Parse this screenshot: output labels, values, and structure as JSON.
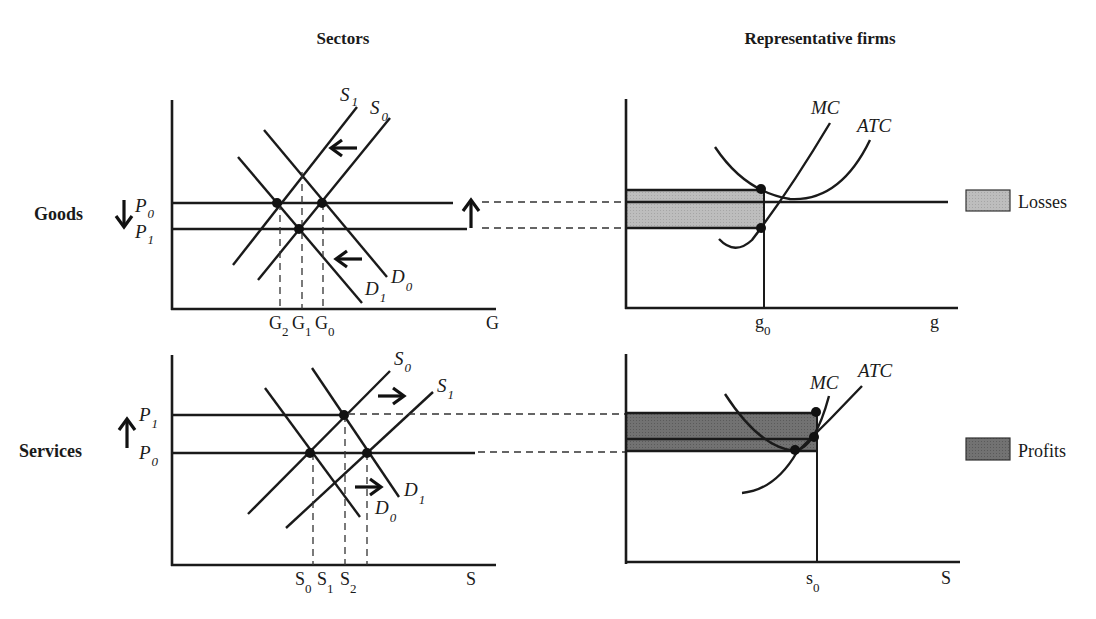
{
  "titles": {
    "sectors": "Sectors",
    "firms": "Representative firms"
  },
  "rows": {
    "goods": {
      "label": "Goods",
      "price_arrow": "↓",
      "firm_arrow": "↑"
    },
    "services": {
      "label": "Services",
      "price_arrow": "↑"
    }
  },
  "goods_sector": {
    "price_labels": [
      {
        "main": "P",
        "sub": "0"
      },
      {
        "main": "P",
        "sub": "1"
      }
    ],
    "curve_labels": {
      "S1": {
        "main": "S",
        "sub": "1"
      },
      "S0": {
        "main": "S",
        "sub": "0"
      },
      "D1": {
        "main": "D",
        "sub": "1"
      },
      "D0": {
        "main": "D",
        "sub": "0"
      }
    },
    "quantity_ticks": [
      {
        "main": "G",
        "sub": "2"
      },
      {
        "main": "G",
        "sub": "1"
      },
      {
        "main": "G",
        "sub": "0"
      }
    ],
    "x_axis_label": "G",
    "shift_arrows": [
      "←",
      "←"
    ]
  },
  "services_sector": {
    "price_labels": [
      {
        "main": "P",
        "sub": "1"
      },
      {
        "main": "P",
        "sub": "0"
      }
    ],
    "curve_labels": {
      "S0": {
        "main": "S",
        "sub": "0"
      },
      "S1": {
        "main": "S",
        "sub": "1"
      },
      "D1": {
        "main": "D",
        "sub": "1"
      },
      "D0": {
        "main": "D",
        "sub": "0"
      }
    },
    "quantity_ticks": [
      {
        "main": "S",
        "sub": "0"
      },
      {
        "main": "S",
        "sub": "1"
      },
      {
        "main": "S",
        "sub": "2"
      }
    ],
    "x_axis_label": "S",
    "shift_arrows": [
      "→",
      "→"
    ]
  },
  "goods_firm": {
    "curve_labels": {
      "mc": "MC",
      "atc": "ATC"
    },
    "quantity_tick": {
      "main": "g",
      "sub": "0"
    },
    "x_axis_label": "g",
    "legend": {
      "label": "Losses",
      "color": "#b8b8b8"
    }
  },
  "services_firm": {
    "curve_labels": {
      "mc": "MC",
      "atc": "ATC"
    },
    "quantity_tick": {
      "main": "s",
      "sub": "0"
    },
    "x_axis_label": "S",
    "legend": {
      "label": "Profits",
      "color": "#6e6e6e"
    }
  },
  "colors": {
    "ink": "#1a1a1a",
    "losses_fill": "#b8b8b8",
    "profits_fill": "#6e6e6e",
    "background": "#ffffff"
  }
}
